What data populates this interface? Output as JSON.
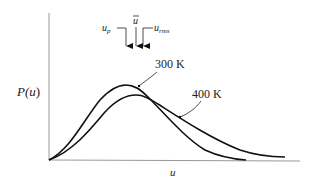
{
  "diagram": {
    "type": "distribution-curves",
    "y_axis_label": "P(u)",
    "x_axis_label": "u",
    "curves": [
      {
        "name": "300 K",
        "label": "300 K",
        "peak": "higher, narrower"
      },
      {
        "name": "400 K",
        "label": "400 K",
        "peak": "lower, broader"
      }
    ],
    "markers": [
      {
        "symbol": "u",
        "subscript": "p",
        "label": "u_p"
      },
      {
        "symbol": "u",
        "overbar": true,
        "label": "ū"
      },
      {
        "symbol": "u",
        "subscript": "rms",
        "label": "u_rms"
      }
    ]
  },
  "labels": {
    "y_axis": "P(u)",
    "y_axis_main": "P(",
    "y_axis_var": "u",
    "y_axis_close": ")",
    "x_axis": "u",
    "curve_300": "300 K",
    "curve_400": "400 K",
    "up_main": "u",
    "up_sub": "p",
    "ubar": "u",
    "urms_main": "u",
    "urms_sub": "rms"
  }
}
